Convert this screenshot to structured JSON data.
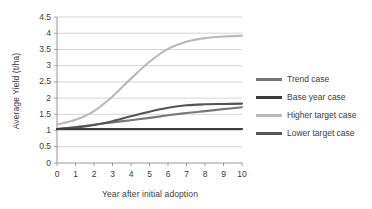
{
  "chart_data": {
    "type": "line",
    "title": "",
    "xlabel": "Year after initial adoption",
    "ylabel": "Average Yield (t/ha)",
    "x": [
      0,
      1,
      2,
      3,
      4,
      5,
      6,
      7,
      8,
      9,
      10
    ],
    "xlim": [
      0,
      10
    ],
    "ylim": [
      0,
      4.5
    ],
    "xticks": [
      "0",
      "1",
      "2",
      "3",
      "4",
      "5",
      "6",
      "7",
      "8",
      "9",
      "10"
    ],
    "yticks": [
      "0",
      "0.5",
      "1",
      "1.5",
      "2",
      "2.5",
      "3",
      "3.5",
      "4",
      "4.5"
    ],
    "grid": "horizontal",
    "legend_position": "right",
    "series": [
      {
        "name": "Trend case",
        "color": "#777777",
        "values": [
          1.05,
          1.11,
          1.18,
          1.25,
          1.32,
          1.39,
          1.47,
          1.54,
          1.6,
          1.66,
          1.72
        ]
      },
      {
        "name": "Base year case",
        "color": "#3d3d3d",
        "values": [
          1.05,
          1.05,
          1.05,
          1.05,
          1.05,
          1.05,
          1.05,
          1.05,
          1.05,
          1.05,
          1.05
        ]
      },
      {
        "name": "Higher target case",
        "color": "#b9b9b9",
        "values": [
          1.18,
          1.33,
          1.6,
          2.05,
          2.6,
          3.12,
          3.52,
          3.74,
          3.85,
          3.9,
          3.92
        ]
      },
      {
        "name": "Lower target case",
        "color": "#545454",
        "values": [
          1.05,
          1.09,
          1.17,
          1.29,
          1.44,
          1.58,
          1.7,
          1.78,
          1.81,
          1.82,
          1.83
        ]
      }
    ]
  },
  "legend": {
    "items": [
      {
        "label": "Trend case"
      },
      {
        "label": "Base year case"
      },
      {
        "label": "Higher target case"
      },
      {
        "label": "Lower target case"
      }
    ]
  },
  "axes": {
    "y_title": "Average Yield (t/ha)",
    "x_title": "Year after initial adoption"
  }
}
